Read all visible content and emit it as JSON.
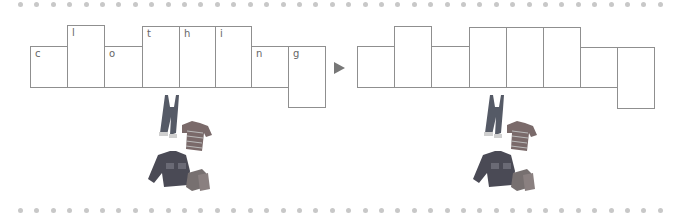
{
  "worksheet": {
    "word": "clothing",
    "letters": [
      "c",
      "l",
      "o",
      "t",
      "h",
      "i",
      "n",
      "g"
    ],
    "source_boxes": [
      {
        "letter": "c",
        "shape": "short"
      },
      {
        "letter": "l",
        "shape": "tall"
      },
      {
        "letter": "o",
        "shape": "short"
      },
      {
        "letter": "t",
        "shape": "tall"
      },
      {
        "letter": "h",
        "shape": "tall"
      },
      {
        "letter": "i",
        "shape": "tall"
      },
      {
        "letter": "n",
        "shape": "short"
      },
      {
        "letter": "g",
        "shape": "descender"
      }
    ],
    "answer_boxes": [
      {
        "letter": "",
        "shape": "short"
      },
      {
        "letter": "",
        "shape": "tall"
      },
      {
        "letter": "",
        "shape": "short"
      },
      {
        "letter": "",
        "shape": "tall"
      },
      {
        "letter": "",
        "shape": "tall"
      },
      {
        "letter": "",
        "shape": "tall"
      },
      {
        "letter": "",
        "shape": "short"
      },
      {
        "letter": "",
        "shape": "descender"
      }
    ],
    "arrow_icon": "right-triangle-arrow",
    "illustration": "clothing-pile (overalls, striped shirt, jacket, boots)",
    "colors": {
      "box_border": "#8f8f8f",
      "letter": "#666666",
      "dots": "#c8c8c8",
      "arrow": "#777777"
    }
  }
}
